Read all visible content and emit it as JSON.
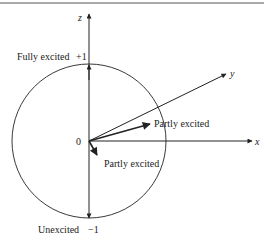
{
  "diagram": {
    "type": "bloch-sphere",
    "axes": {
      "z": "z",
      "y": "y",
      "x": "x"
    },
    "origin_label": "0",
    "labels": {
      "top_state": "Fully excited",
      "top_value": "+1",
      "bottom_state": "Unexcited",
      "bottom_value": "−1",
      "partly_upper": "Partly excited",
      "partly_lower": "Partly excited"
    },
    "colors": {
      "stroke": "#222222",
      "background": "#ffffff",
      "border": "#555555"
    }
  }
}
